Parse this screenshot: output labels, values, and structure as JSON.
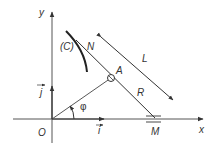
{
  "diagram": {
    "labels": {
      "y_axis": "y",
      "x_axis": "x",
      "origin": "O",
      "unit_i": "i",
      "unit_j": "j",
      "angle": "φ",
      "curve": "(C)",
      "point_n": "N",
      "point_a": "A",
      "point_m": "M",
      "length_l": "L",
      "length_r": "R"
    },
    "colors": {
      "line": "#333333",
      "axis": "#555555"
    }
  }
}
